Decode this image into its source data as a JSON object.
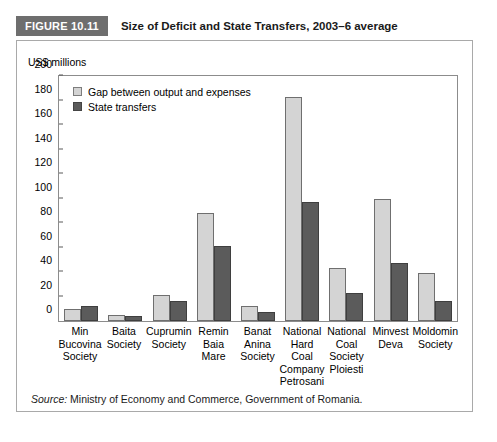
{
  "figure": {
    "badge": "FIGURE 10.11",
    "title": "Size of Deficit and State Transfers, 2003–6 average"
  },
  "source": {
    "prefix": "Source:",
    "text": " Ministry of Economy and Commerce, Government of Romania."
  },
  "colors": {
    "badge_bg": "#6e6e6e",
    "series_light": "#d4d4d4",
    "series_dark": "#5b5b5b",
    "frame": "#a9a9a9",
    "axis": "#8c8c8c"
  },
  "chart_data": {
    "type": "bar",
    "title": "Size of Deficit and State Transfers, 2003–6 average",
    "xlabel": "",
    "ylabel": "US$ millions",
    "ylim": [
      0,
      200
    ],
    "yticks": [
      0,
      20,
      40,
      60,
      80,
      100,
      120,
      140,
      160,
      180,
      200
    ],
    "grid": false,
    "legend_position": "top-left",
    "categories": [
      "Min Bucovina Society",
      "Baita Society",
      "Cuprumin Society",
      "Remin Baia Mare",
      "Banat Anina Society",
      "National Hard Coal Company Petrosani",
      "National Coal Society Ploiesti",
      "Minvest Deva",
      "Moldomin Society"
    ],
    "category_lines": [
      [
        "Min",
        "Bucovina",
        "Society"
      ],
      [
        "Baita",
        "Society"
      ],
      [
        "Cuprumin",
        "Society"
      ],
      [
        "Remin",
        "Baia",
        "Mare"
      ],
      [
        "Banat",
        "Anina",
        "Society"
      ],
      [
        "National",
        "Hard",
        "Coal",
        "Company",
        "Petrosani"
      ],
      [
        "National",
        "Coal",
        "Society",
        "Ploiesti"
      ],
      [
        "Minvest",
        "Deva"
      ],
      [
        "Moldomin",
        "Society"
      ]
    ],
    "series": [
      {
        "name": "Gap between output and expenses",
        "color": "#d4d4d4",
        "values": [
          10,
          5,
          21,
          88,
          12,
          183,
          43,
          100,
          39
        ]
      },
      {
        "name": "State transfers",
        "color": "#5b5b5b",
        "values": [
          12,
          4,
          16,
          61,
          7,
          97,
          23,
          47,
          16
        ]
      }
    ]
  }
}
